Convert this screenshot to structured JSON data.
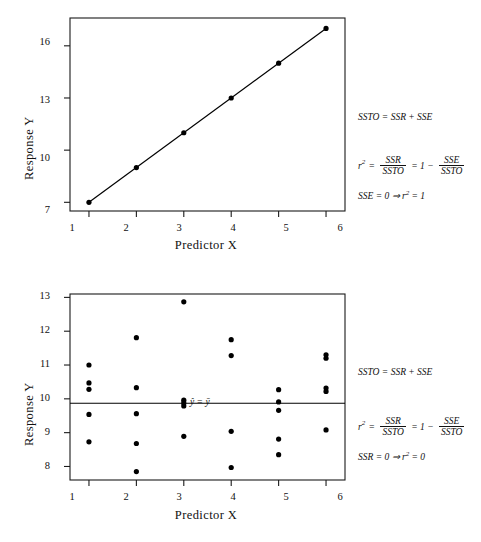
{
  "figure": {
    "panels": [
      {
        "id": "top",
        "xlabel": "Predictor X",
        "ylabel": "Response Y",
        "xticks": [
          "1",
          "2",
          "3",
          "4",
          "5",
          "6"
        ],
        "yticks": [
          "7",
          "10",
          "13",
          "16"
        ],
        "mean_line_label": ""
      },
      {
        "id": "bottom",
        "xlabel": "Predictor X",
        "ylabel": "Response Y",
        "xticks": [
          "1",
          "2",
          "3",
          "4",
          "5",
          "6"
        ],
        "yticks": [
          "8",
          "9",
          "10",
          "11",
          "12",
          "13"
        ],
        "mean_line_label": "ŷ = ȳ"
      }
    ]
  },
  "formulas": {
    "top": {
      "line1": "SSTO = SSR + SSE",
      "line2_lhs": "r",
      "line2_lhs_sup": "2",
      "line2_eq1": "=",
      "line2_frac1_num": "SSR",
      "line2_frac1_den": "SSTO",
      "line2_eq2": "= 1 −",
      "line2_frac2_num": "SSE",
      "line2_frac2_den": "SSTO",
      "line3": "SSE = 0 ⇒ r² = 1",
      "line3_a": "SSE = 0 ⇒ r",
      "line3_sup": "2",
      "line3_b": "= 1"
    },
    "bottom": {
      "line1": "SSTO = SSR + SSE",
      "line2_lhs": "r",
      "line2_lhs_sup": "2",
      "line2_eq1": "=",
      "line2_frac1_num": "SSR",
      "line2_frac1_den": "SSTO",
      "line2_eq2": "= 1 −",
      "line2_frac2_num": "SSE",
      "line2_frac2_den": "SSTO",
      "line3": "SSR = 0 ⇒ r² = 0",
      "line3_a": "SSR = 0 ⇒ r",
      "line3_sup": "2",
      "line3_b": "= 0"
    }
  },
  "chart_data": [
    {
      "type": "scatter",
      "id": "top-panel",
      "title": "",
      "xlabel": "Predictor X",
      "ylabel": "Response Y",
      "xlim": [
        0.6,
        6.4
      ],
      "ylim": [
        6.5,
        17.6
      ],
      "xticks": [
        1,
        2,
        3,
        4,
        5,
        6
      ],
      "yticks": [
        7,
        10,
        13,
        16
      ],
      "grid": false,
      "legend": null,
      "series": [
        {
          "name": "observations",
          "marker": "filled-circle",
          "color": "#000000",
          "x": [
            1,
            2,
            3,
            4,
            5,
            6
          ],
          "y": [
            7.0,
            9.0,
            11.0,
            13.0,
            15.0,
            17.0
          ]
        }
      ],
      "fit_line": {
        "name": "regression line",
        "color": "#000000",
        "x": [
          1,
          6
        ],
        "y": [
          7.0,
          17.0
        ],
        "slope": 2.0,
        "intercept": 5.0
      },
      "annotations": [
        "SSTO = SSR + SSE",
        "r² = SSR/SSTO = 1 − SSE/SSTO",
        "SSE = 0 ⇒ r² = 1"
      ]
    },
    {
      "type": "scatter",
      "id": "bottom-panel",
      "title": "",
      "xlabel": "Predictor X",
      "ylabel": "Response Y",
      "xlim": [
        0.6,
        6.4
      ],
      "ylim": [
        7.6,
        13.1
      ],
      "xticks": [
        1,
        2,
        3,
        4,
        5,
        6
      ],
      "yticks": [
        8,
        9,
        10,
        11,
        12,
        13
      ],
      "grid": false,
      "legend": null,
      "series": [
        {
          "name": "observations",
          "marker": "filled-circle",
          "color": "#000000",
          "points": [
            [
              1,
              11.0
            ],
            [
              1,
              10.47
            ],
            [
              1,
              10.28
            ],
            [
              1,
              9.54
            ],
            [
              1,
              8.73
            ],
            [
              2,
              11.81
            ],
            [
              2,
              10.33
            ],
            [
              2,
              9.56
            ],
            [
              2,
              8.68
            ],
            [
              2,
              7.85
            ],
            [
              3,
              12.87
            ],
            [
              3,
              9.96
            ],
            [
              3,
              9.88
            ],
            [
              3,
              9.79
            ],
            [
              3,
              8.89
            ],
            [
              4,
              11.75
            ],
            [
              4,
              11.28
            ],
            [
              4,
              9.04
            ],
            [
              4,
              7.97
            ],
            [
              5,
              10.27
            ],
            [
              5,
              9.91
            ],
            [
              5,
              9.66
            ],
            [
              5,
              8.81
            ],
            [
              5,
              8.35
            ],
            [
              6,
              11.3
            ],
            [
              6,
              11.2
            ],
            [
              6,
              10.32
            ],
            [
              6,
              10.22
            ],
            [
              6,
              9.08
            ]
          ]
        }
      ],
      "fit_line": {
        "name": "mean line",
        "label": "ŷ = ȳ",
        "color": "#000000",
        "x": [
          0.6,
          6.4
        ],
        "y": [
          9.87,
          9.87
        ],
        "slope": 0.0,
        "intercept": 9.87
      },
      "annotations": [
        "SSTO = SSR + SSE",
        "r² = SSR/SSTO = 1 − SSE/SSTO",
        "SSR = 0 ⇒ r² = 0"
      ]
    }
  ]
}
